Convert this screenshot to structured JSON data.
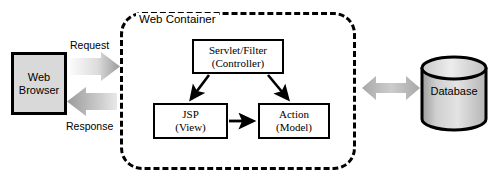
{
  "diagram": {
    "background_color": "#ffffff",
    "line_color": "#000000"
  },
  "browser": {
    "label": "Web\nBrowser",
    "fill_color": "#d9d9d9",
    "border_color": "#000000"
  },
  "flows": {
    "request_label": "Request",
    "response_label": "Response",
    "request_arrow_name": "request-block-arrow",
    "response_arrow_name": "response-block-arrow",
    "arrow_fill_light": "#f2f2f2",
    "arrow_fill_dark": "#a6a6a6"
  },
  "container": {
    "label": "Web Container",
    "border_style": "dashed",
    "border_color": "#000000"
  },
  "components": [
    {
      "id": "servlet-filter",
      "label": "Servlet/Filter\n(Controller)",
      "role": "Controller"
    },
    {
      "id": "jsp",
      "label": "JSP\n(View)",
      "role": "View"
    },
    {
      "id": "action",
      "label": "Action\n(Model)",
      "role": "Model"
    }
  ],
  "database": {
    "label": "Database",
    "fill_color": "#c8c8c8",
    "border_color": "#000000"
  },
  "connections": [
    {
      "from": "servlet-filter",
      "to": "jsp",
      "style": "solid-arrow"
    },
    {
      "from": "servlet-filter",
      "to": "action",
      "style": "solid-arrow"
    },
    {
      "from": "jsp",
      "to": "action",
      "style": "solid-arrow"
    },
    {
      "from": "web-container",
      "to": "database",
      "style": "double-block-arrow"
    }
  ]
}
